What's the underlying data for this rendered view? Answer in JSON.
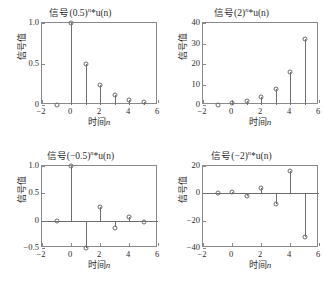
{
  "figure": {
    "width": 323,
    "height": 286,
    "background": "#ffffff",
    "axis_color": "#8a8a8a",
    "stem_color": "#6e6e6e",
    "layout": "2x2 grid of stem plots"
  },
  "common": {
    "xlabel_prefix": "时间",
    "xlabel_var": "n",
    "ylabel": "信号值",
    "title_prefix": "信号",
    "exponent": "n",
    "title_suffix": "*u(n)"
  },
  "chart_data": [
    {
      "type": "line",
      "panel": "top-left",
      "title": "信号(0.5)ⁿ*u(n)",
      "title_base": "信号(0.5)",
      "title_tail": "*u(n)",
      "xlabel": "时间n",
      "ylabel": "信号值",
      "x": [
        -1,
        0,
        1,
        2,
        3,
        4,
        5
      ],
      "values": [
        0,
        1.0,
        0.5,
        0.25,
        0.125,
        0.0625,
        0.03125
      ],
      "xlim": [
        -2,
        6
      ],
      "ylim": [
        0,
        1.0
      ],
      "xticks": [
        -2,
        0,
        2,
        4,
        6
      ],
      "xticklabels": [
        "−2",
        "0",
        "2",
        "4",
        "6"
      ],
      "yticks": [
        0,
        0.5,
        1.0
      ],
      "yticklabels": [
        "0",
        "0.5",
        "1.0"
      ],
      "grid": false,
      "legend": "none",
      "baseline": 0
    },
    {
      "type": "line",
      "panel": "top-right",
      "title": "信号(2)ⁿ*u(n)",
      "title_base": "信号(2)",
      "title_tail": "*u(n)",
      "xlabel": "时间n",
      "ylabel": "信号值",
      "x": [
        -1,
        0,
        1,
        2,
        3,
        4,
        5
      ],
      "values": [
        0,
        1,
        2,
        4,
        8,
        16,
        32
      ],
      "xlim": [
        -2,
        6
      ],
      "ylim": [
        0,
        40
      ],
      "xticks": [
        -2,
        0,
        2,
        4,
        6
      ],
      "xticklabels": [
        "−2",
        "0",
        "2",
        "4",
        "6"
      ],
      "yticks": [
        0,
        10,
        20,
        30,
        40
      ],
      "yticklabels": [
        "0",
        "10",
        "20",
        "30",
        "40"
      ],
      "grid": false,
      "legend": "none",
      "baseline": 0
    },
    {
      "type": "line",
      "panel": "bottom-left",
      "title": "信号(−0.5)ⁿ*u(n)",
      "title_base": "信号(−0.5)",
      "title_tail": "*u(n)",
      "xlabel": "时间n",
      "ylabel": "信号值",
      "x": [
        -1,
        0,
        1,
        2,
        3,
        4,
        5
      ],
      "values": [
        0,
        1.0,
        -0.5,
        0.25,
        -0.125,
        0.0625,
        -0.03125
      ],
      "xlim": [
        -2,
        6
      ],
      "ylim": [
        -0.5,
        1.0
      ],
      "xticks": [
        -2,
        0,
        2,
        4,
        6
      ],
      "xticklabels": [
        "−2",
        "0",
        "2",
        "4",
        "6"
      ],
      "yticks": [
        -0.5,
        0,
        0.5,
        1.0
      ],
      "yticklabels": [
        "−0.5",
        "0",
        "0.5",
        "1.0"
      ],
      "grid": false,
      "legend": "none",
      "baseline": 0
    },
    {
      "type": "line",
      "panel": "bottom-right",
      "title": "信号(−2)ⁿ*u(n)",
      "title_base": "信号(−2)",
      "title_tail": "*u(n)",
      "xlabel": "时间n",
      "ylabel": "信号值",
      "x": [
        -1,
        0,
        1,
        2,
        3,
        4,
        5
      ],
      "values": [
        0,
        1,
        -2,
        4,
        -8,
        16,
        -32
      ],
      "xlim": [
        -2,
        6
      ],
      "ylim": [
        -40,
        20
      ],
      "xticks": [
        -2,
        0,
        2,
        4,
        6
      ],
      "xticklabels": [
        "−2",
        "0",
        "2",
        "4",
        "6"
      ],
      "yticks": [
        -40,
        -20,
        0,
        20
      ],
      "yticklabels": [
        "−40",
        "−20",
        "0",
        "20"
      ],
      "grid": false,
      "legend": "none",
      "baseline": 0
    }
  ]
}
